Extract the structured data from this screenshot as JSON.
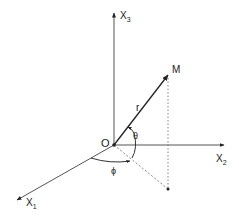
{
  "diagram": {
    "type": "spherical-coordinates",
    "colors": {
      "line": "#333333",
      "dashed": "#555555",
      "background": "#ffffff"
    },
    "axes": {
      "x1": {
        "label": "X",
        "subscript": "1"
      },
      "x2": {
        "label": "X",
        "subscript": "2"
      },
      "x3": {
        "label": "X",
        "subscript": "3"
      }
    },
    "origin": {
      "label": "O"
    },
    "point": {
      "label": "M"
    },
    "radius": {
      "label": "r"
    },
    "angles": {
      "theta": {
        "label": "θ"
      },
      "phi": {
        "label": "ϕ"
      }
    }
  }
}
